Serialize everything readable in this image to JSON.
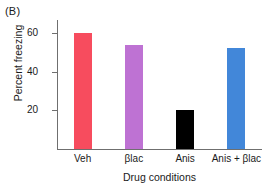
{
  "panel": {
    "label": "(B)"
  },
  "chart_data": {
    "type": "bar",
    "title": "",
    "xlabel": "Drug conditions",
    "ylabel": "Percent freezing",
    "categories": [
      "Veh",
      "βlac",
      "Anis",
      "Anis + βlac"
    ],
    "values": [
      60,
      54,
      20,
      52
    ],
    "colors": [
      "#f74c5e",
      "#be72d3",
      "#000000",
      "#4287d9"
    ],
    "ylim": [
      0,
      67
    ],
    "yticks": [
      20,
      40,
      60
    ],
    "ytick_labels": [
      "20",
      "40",
      "60"
    ],
    "grid": false,
    "legend": "none"
  }
}
